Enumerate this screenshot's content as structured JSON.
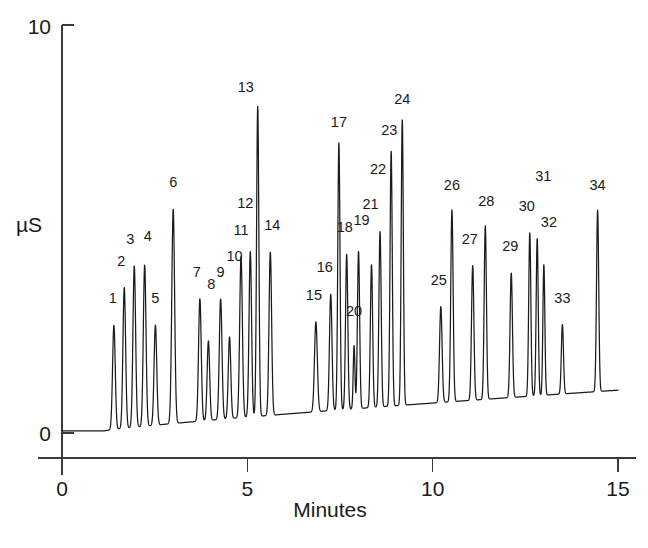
{
  "chart_data": {
    "type": "line",
    "title": "",
    "xlabel": "Minutes",
    "ylabel": "µS",
    "xlim": [
      0,
      15
    ],
    "ylim": [
      0,
      10
    ],
    "xticks": [
      0,
      5,
      10,
      15
    ],
    "xtick_labels": [
      "0",
      "5",
      "10",
      "15"
    ],
    "yticks": [
      0,
      10
    ],
    "ytick_labels": [
      "0",
      "10"
    ],
    "grid": false,
    "legend": "none",
    "baseline_start": 0.05,
    "baseline_end": 1.05,
    "series": [
      {
        "name": "Conductivity",
        "peaks": [
          {
            "id": 1,
            "label": "1",
            "rt": 1.4,
            "height": 2.55,
            "width": 0.085,
            "label_dx": -1,
            "label_dy": -22
          },
          {
            "id": 2,
            "label": "2",
            "rt": 1.68,
            "height": 3.45,
            "width": 0.085,
            "label_dx": -3,
            "label_dy": -22
          },
          {
            "id": 3,
            "label": "3",
            "rt": 1.95,
            "height": 3.95,
            "width": 0.085,
            "label_dx": -4,
            "label_dy": -22
          },
          {
            "id": 4,
            "label": "4",
            "rt": 2.23,
            "height": 3.95,
            "width": 0.085,
            "label_dx": 3,
            "label_dy": -24
          },
          {
            "id": 5,
            "label": "5",
            "rt": 2.52,
            "height": 2.45,
            "width": 0.085,
            "label_dx": 0,
            "label_dy": -22
          },
          {
            "id": 6,
            "label": "6",
            "rt": 3.0,
            "height": 5.25,
            "width": 0.09,
            "label_dx": 0,
            "label_dy": -22
          },
          {
            "id": 7,
            "label": "7",
            "rt": 3.72,
            "height": 3.0,
            "width": 0.085,
            "label_dx": -3,
            "label_dy": -22
          },
          {
            "id": 8,
            "label": "8",
            "rt": 3.95,
            "height": 1.95,
            "width": 0.08,
            "label_dx": 3,
            "label_dy": -52
          },
          {
            "id": 9,
            "label": "9",
            "rt": 4.28,
            "height": 2.95,
            "width": 0.085,
            "label_dx": 0,
            "label_dy": -22
          },
          {
            "id": 10,
            "label": "10",
            "rt": 4.52,
            "height": 2.0,
            "width": 0.08,
            "label_dx": 5,
            "label_dy": -76
          },
          {
            "id": 11,
            "label": "11",
            "rt": 4.83,
            "height": 3.95,
            "width": 0.085,
            "label_dx": 0,
            "label_dy": -22
          },
          {
            "id": 12,
            "label": "12",
            "rt": 5.08,
            "height": 4.05,
            "width": 0.08,
            "label_dx": -5,
            "label_dy": -44
          },
          {
            "id": 13,
            "label": "13",
            "rt": 5.28,
            "height": 7.6,
            "width": 0.072,
            "label_dx": -12,
            "label_dy": -14
          },
          {
            "id": 14,
            "label": "14",
            "rt": 5.62,
            "height": 4.0,
            "width": 0.082,
            "label_dx": 2,
            "label_dy": -22
          },
          {
            "id": 15,
            "label": "15",
            "rt": 6.85,
            "height": 2.2,
            "width": 0.09,
            "label_dx": -2,
            "label_dy": -22
          },
          {
            "id": 16,
            "label": "16",
            "rt": 7.25,
            "height": 2.85,
            "width": 0.08,
            "label_dx": -6,
            "label_dy": -22
          },
          {
            "id": 17,
            "label": "17",
            "rt": 7.47,
            "height": 6.55,
            "width": 0.07,
            "label_dx": 0,
            "label_dy": -16
          },
          {
            "id": 18,
            "label": "18",
            "rt": 7.68,
            "height": 3.8,
            "width": 0.072,
            "label_dx": -2,
            "label_dy": -22
          },
          {
            "id": 19,
            "label": "19",
            "rt": 8.0,
            "height": 3.85,
            "width": 0.07,
            "label_dx": 3,
            "label_dy": -26
          },
          {
            "id": 20,
            "label": "20",
            "rt": 7.88,
            "height": 1.55,
            "width": 0.055,
            "label_dx": 0,
            "label_dy": -30
          },
          {
            "id": 21,
            "label": "21",
            "rt": 8.35,
            "height": 3.5,
            "width": 0.072,
            "label_dx": -1,
            "label_dy": -56
          },
          {
            "id": 22,
            "label": "22",
            "rt": 8.58,
            "height": 4.3,
            "width": 0.072,
            "label_dx": -2,
            "label_dy": -58
          },
          {
            "id": 23,
            "label": "23",
            "rt": 8.88,
            "height": 6.25,
            "width": 0.07,
            "label_dx": -2,
            "label_dy": -16
          },
          {
            "id": 24,
            "label": "24",
            "rt": 9.18,
            "height": 7.0,
            "width": 0.068,
            "label_dx": 0,
            "label_dy": -16
          },
          {
            "id": 25,
            "label": "25",
            "rt": 10.22,
            "height": 2.35,
            "width": 0.08,
            "label_dx": -2,
            "label_dy": -22
          },
          {
            "id": 26,
            "label": "26",
            "rt": 10.52,
            "height": 4.7,
            "width": 0.075,
            "label_dx": 0,
            "label_dy": -20
          },
          {
            "id": 27,
            "label": "27",
            "rt": 11.08,
            "height": 3.3,
            "width": 0.075,
            "label_dx": -3,
            "label_dy": -22
          },
          {
            "id": 28,
            "label": "28",
            "rt": 11.42,
            "height": 4.25,
            "width": 0.072,
            "label_dx": 1,
            "label_dy": -20
          },
          {
            "id": 29,
            "label": "29",
            "rt": 12.12,
            "height": 3.05,
            "width": 0.075,
            "label_dx": -1,
            "label_dy": -22
          },
          {
            "id": 30,
            "label": "30",
            "rt": 12.62,
            "height": 4.0,
            "width": 0.068,
            "label_dx": -3,
            "label_dy": -22
          },
          {
            "id": 31,
            "label": "31",
            "rt": 12.82,
            "height": 3.85,
            "width": 0.065,
            "label_dx": 6,
            "label_dy": -58
          },
          {
            "id": 32,
            "label": "32",
            "rt": 13.0,
            "height": 3.2,
            "width": 0.062,
            "label_dx": 5,
            "label_dy": -38
          },
          {
            "id": 33,
            "label": "33",
            "rt": 13.5,
            "height": 1.7,
            "width": 0.068,
            "label_dx": 0,
            "label_dy": -22
          },
          {
            "id": 34,
            "label": "34",
            "rt": 14.45,
            "height": 4.45,
            "width": 0.07,
            "label_dx": 0,
            "label_dy": -20
          }
        ]
      }
    ],
    "colors": {
      "trace": "#1b1b1b",
      "axis": "#3a3a3a",
      "text": "#1a1a1a",
      "background": "#ffffff"
    }
  },
  "axes": {
    "y_top_label": "10",
    "y_bottom_label": "0",
    "y_title": "µS",
    "x_labels": [
      "0",
      "5",
      "10",
      "15"
    ],
    "x_title": "Minutes"
  }
}
